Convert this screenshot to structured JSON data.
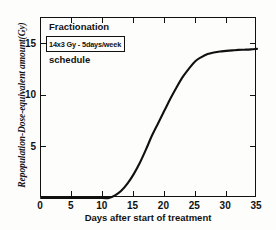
{
  "chart_data": {
    "type": "line",
    "title": "",
    "xlabel": "Days after start of treatment",
    "ylabel": "Repopulation-Dose-equivalent amount(Gy)",
    "xlim": [
      0,
      35
    ],
    "ylim": [
      0,
      17.5
    ],
    "grid": false,
    "legend": null,
    "xticks": [
      0,
      5,
      10,
      15,
      20,
      25,
      30,
      35
    ],
    "xtick_labels": [
      "0",
      "5",
      "10",
      "15",
      "20",
      "25",
      "30",
      "35"
    ],
    "yticks": [
      5,
      10,
      15
    ],
    "ytick_labels": [
      "5",
      "10",
      "15"
    ],
    "series": [
      {
        "name": "Repopulation dose-equivalent",
        "x": [
          0,
          2,
          4,
          6,
          8,
          10,
          11,
          12,
          13,
          14,
          15,
          16,
          17,
          18,
          19,
          20,
          21,
          22,
          23,
          24,
          25,
          26,
          27,
          28,
          29,
          30,
          31,
          32,
          33,
          34,
          35
        ],
        "y": [
          0,
          0,
          0,
          0,
          0,
          0,
          0.0,
          0.25,
          0.7,
          1.4,
          2.3,
          3.4,
          4.7,
          6.1,
          7.3,
          8.5,
          9.7,
          10.8,
          11.8,
          12.6,
          13.3,
          13.7,
          14.0,
          14.15,
          14.25,
          14.3,
          14.35,
          14.4,
          14.42,
          14.45,
          14.5
        ]
      }
    ],
    "annotations": {
      "line1": "Fractionation",
      "boxed": "14x3 Gy  -  5days/week",
      "line3": "schedule"
    }
  },
  "axes": {
    "x_title": "Days after start of treatment",
    "y_title": "Repopulation-Dose-equivalent amount(Gy)"
  },
  "colors": {
    "curve": "#101010",
    "frame": "#111111",
    "background": "#fdfdfc"
  }
}
